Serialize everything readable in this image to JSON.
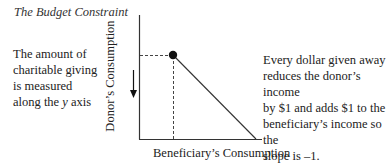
{
  "title": "The Budget Constraint",
  "left_note": {
    "line1": "The amount of",
    "line2": "charitable giving",
    "line3": "is measured",
    "line4_prefix": "along the ",
    "line4_var": "y",
    "line4_suffix": " axis"
  },
  "right_note": {
    "line1": "Every dollar given away",
    "line2": "reduces the donor’s income",
    "line3": "by $1 and adds $1 to the",
    "line4": "beneficiary’s income so the",
    "line5": "slope is –1."
  },
  "axes": {
    "y_label": "Donor’s Consumption",
    "x_label": "Beneficiary’s Consumption"
  },
  "diagram": {
    "point_label": "endowment / chosen point",
    "slope": "-1",
    "arrow_direction": "down"
  }
}
